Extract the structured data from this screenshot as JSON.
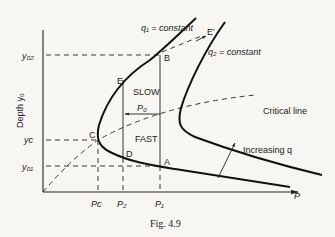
{
  "figure": {
    "caption": "Fig. 4.9",
    "y_axis_label": "Depth y₀",
    "x_axis_label": "P",
    "y_ticks": {
      "y02": "y₀₂",
      "yc": "yᴄ",
      "y01": "y₀₁"
    },
    "x_ticks": {
      "pc": "Pᴄ",
      "p2": "P₂",
      "p1": "P₁"
    },
    "curves": {
      "q1_label": "q₁ = constant",
      "q2_label": "q₂ = constant",
      "critical_line_label": "Critical line",
      "increasing_q_label": "Increasing q"
    },
    "points": {
      "A": "A",
      "B": "B",
      "C": "C",
      "D": "D",
      "E": "E",
      "E_prime": "E'"
    },
    "regions": {
      "slow": "SLOW",
      "fast": "FAST",
      "p0": "P₀"
    }
  }
}
